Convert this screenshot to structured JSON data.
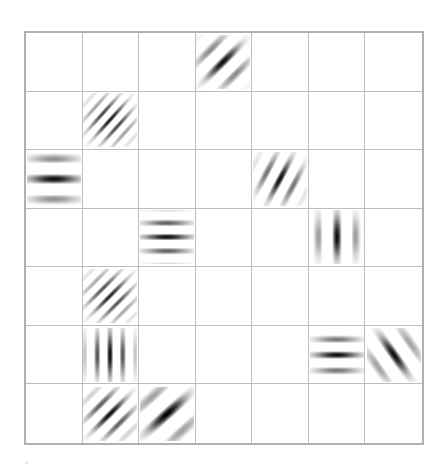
{
  "canvas": {
    "width": 447,
    "height": 474,
    "background_color": "#ffffff"
  },
  "grid": {
    "rows": 7,
    "columns": 7,
    "left": 24,
    "top": 31,
    "width": 400,
    "height": 414,
    "line_color": "#bdbdbd",
    "border_color": "#b0b0b0",
    "border_width": 2
  },
  "chart_data": {
    "type": "heatmap",
    "title": "",
    "subtitle": "",
    "xlabel": "",
    "ylabel": "",
    "grid": true,
    "legend": "none",
    "rows": 7,
    "columns": 7,
    "row_labels": [
      "1",
      "2",
      "3",
      "4",
      "5",
      "6",
      "7"
    ],
    "column_labels": [
      "1",
      "2",
      "3",
      "4",
      "5",
      "6",
      "7"
    ],
    "patch_color": "#000000",
    "patches": [
      {
        "id": "patch-r1c4",
        "row": 1,
        "column": 4,
        "orientation_deg": 45,
        "bar_direction": "lower-left to upper-right",
        "cycles": 3.0,
        "spatial_frequency": "medium",
        "sigma": 0.27,
        "contrast": 0.95,
        "phase_deg": 0,
        "size_px": 54
      },
      {
        "id": "patch-r2c2",
        "row": 2,
        "column": 2,
        "orientation_deg": 48,
        "bar_direction": "lower-left to upper-right",
        "cycles": 5.5,
        "spatial_frequency": "high",
        "sigma": 0.27,
        "contrast": 0.9,
        "phase_deg": 0,
        "size_px": 54
      },
      {
        "id": "patch-r3c1",
        "row": 3,
        "column": 1,
        "orientation_deg": 0,
        "bar_direction": "horizontal",
        "cycles": 2.6,
        "spatial_frequency": "low",
        "sigma": 0.3,
        "contrast": 0.95,
        "phase_deg": 0,
        "size_px": 54
      },
      {
        "id": "patch-r3c5",
        "row": 3,
        "column": 5,
        "orientation_deg": 62,
        "bar_direction": "lower-left to upper-right, steep",
        "cycles": 3.6,
        "spatial_frequency": "medium",
        "sigma": 0.26,
        "contrast": 0.95,
        "phase_deg": 0,
        "size_px": 54
      },
      {
        "id": "patch-r4c3",
        "row": 4,
        "column": 3,
        "orientation_deg": 0,
        "bar_direction": "horizontal",
        "cycles": 3.8,
        "spatial_frequency": "medium-high",
        "sigma": 0.28,
        "contrast": 0.95,
        "phase_deg": 0,
        "size_px": 54
      },
      {
        "id": "patch-r4c6",
        "row": 4,
        "column": 6,
        "orientation_deg": 90,
        "bar_direction": "vertical",
        "cycles": 2.8,
        "spatial_frequency": "medium",
        "sigma": 0.26,
        "contrast": 0.95,
        "phase_deg": 0,
        "size_px": 54
      },
      {
        "id": "patch-r5c2",
        "row": 5,
        "column": 2,
        "orientation_deg": 45,
        "bar_direction": "lower-left to upper-right",
        "cycles": 5.2,
        "spatial_frequency": "high",
        "sigma": 0.28,
        "contrast": 0.85,
        "phase_deg": 0,
        "size_px": 54
      },
      {
        "id": "patch-r6c2",
        "row": 6,
        "column": 2,
        "orientation_deg": 90,
        "bar_direction": "vertical",
        "cycles": 4.2,
        "spatial_frequency": "high",
        "sigma": 0.28,
        "contrast": 0.95,
        "phase_deg": 0,
        "size_px": 54
      },
      {
        "id": "patch-r6c6",
        "row": 6,
        "column": 6,
        "orientation_deg": 0,
        "bar_direction": "horizontal",
        "cycles": 3.4,
        "spatial_frequency": "medium",
        "sigma": 0.27,
        "contrast": 0.95,
        "phase_deg": 0,
        "size_px": 54
      },
      {
        "id": "patch-r6c7",
        "row": 6,
        "column": 7,
        "orientation_deg": 125,
        "bar_direction": "upper-left to lower-right",
        "cycles": 2.6,
        "spatial_frequency": "medium",
        "sigma": 0.27,
        "contrast": 0.95,
        "phase_deg": 0,
        "size_px": 54
      },
      {
        "id": "patch-r7c2",
        "row": 7,
        "column": 2,
        "orientation_deg": 45,
        "bar_direction": "lower-left to upper-right",
        "cycles": 4.0,
        "spatial_frequency": "medium-high",
        "sigma": 0.27,
        "contrast": 0.95,
        "phase_deg": 0,
        "size_px": 54
      },
      {
        "id": "patch-r7c3",
        "row": 7,
        "column": 3,
        "orientation_deg": 42,
        "bar_direction": "lower-left to upper-right",
        "cycles": 2.3,
        "spatial_frequency": "low",
        "sigma": 0.3,
        "contrast": 1.0,
        "phase_deg": 0,
        "size_px": 54
      }
    ]
  },
  "artifacts": {
    "speck_visible": true
  }
}
